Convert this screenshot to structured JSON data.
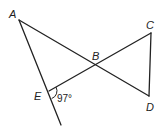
{
  "diagram": {
    "type": "geometry",
    "points": {
      "A": {
        "label": "A",
        "x": 19,
        "y": 20,
        "lx": 9,
        "ly": 18
      },
      "B": {
        "label": "B",
        "x": 95,
        "y": 64,
        "lx": 92,
        "ly": 60
      },
      "C": {
        "label": "C",
        "x": 151,
        "y": 33,
        "lx": 146,
        "ly": 29
      },
      "D": {
        "label": "D",
        "x": 149,
        "y": 96,
        "lx": 146,
        "ly": 111
      },
      "E": {
        "label": "E",
        "x": 49,
        "y": 91,
        "lx": 34,
        "ly": 100
      }
    },
    "segments": [
      {
        "from": "A",
        "to": "D",
        "name": "segment-ad"
      },
      {
        "from": "E",
        "to": "C",
        "name": "segment-ec"
      },
      {
        "from": "C",
        "to": "D",
        "name": "segment-cd"
      },
      {
        "from": "A",
        "to": "ray-end",
        "name": "ray-ae"
      }
    ],
    "ray_end": {
      "x": 61,
      "y": 125
    },
    "angle": {
      "vertex": "E",
      "value": "97°",
      "label_x": 57,
      "label_y": 102
    },
    "colors": {
      "stroke": "#222222",
      "background": "#ffffff"
    }
  }
}
